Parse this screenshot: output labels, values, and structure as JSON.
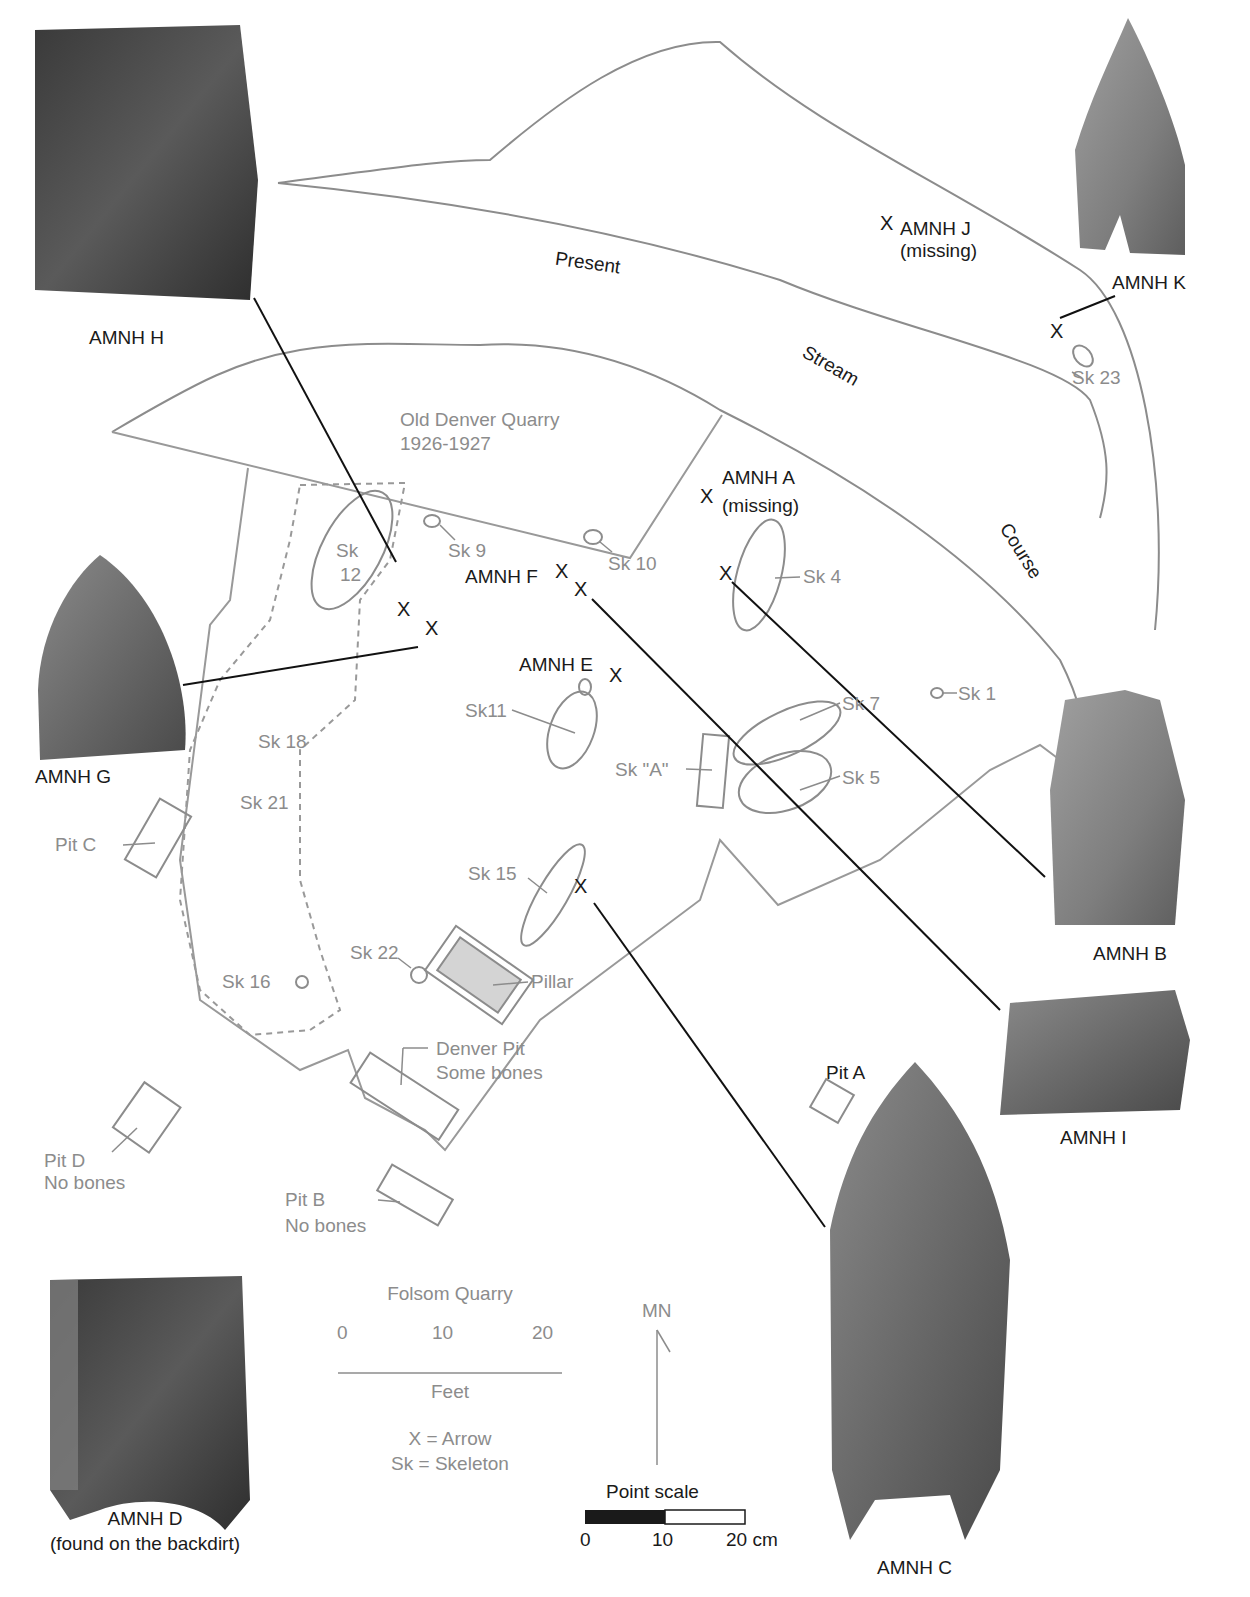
{
  "map": {
    "title": "Folsom Quarry",
    "stream_label": [
      "Present",
      "Stream",
      "Course"
    ],
    "quarry_label": [
      "Old Denver Quarry",
      "1926-1927"
    ],
    "scale": {
      "ticks": [
        "0",
        "10",
        "20"
      ],
      "unit": "Feet"
    },
    "legend": {
      "x": "X = Arrow",
      "sk": "Sk = Skeleton"
    },
    "north": "MN",
    "point_scale": {
      "title": "Point scale",
      "ticks": [
        "0",
        "10",
        "20 cm"
      ]
    }
  },
  "points": {
    "H": "AMNH H",
    "K": "AMNH K",
    "J": "AMNH J",
    "J_note": "(missing)",
    "A": "AMNH A",
    "A_note": "(missing)",
    "F": "AMNH F",
    "E": "AMNH E",
    "G": "AMNH G",
    "B": "AMNH B",
    "I": "AMNH I",
    "C": "AMNH C",
    "D": "AMNH D",
    "D_note": "(found on the backdirt)"
  },
  "skeletons": {
    "sk23": "Sk 23",
    "sk12a": "Sk",
    "sk12b": "12",
    "sk9": "Sk 9",
    "sk10": "Sk 10",
    "sk4": "Sk 4",
    "sk1": "Sk 1",
    "sk11": "Sk11",
    "sk7": "Sk 7",
    "sk5": "Sk 5",
    "skA": "Sk \"A\"",
    "sk18": "Sk 18",
    "sk21": "Sk 21",
    "sk15": "Sk 15",
    "sk22": "Sk 22",
    "sk16": "Sk 16"
  },
  "features": {
    "pillar": "Pillar",
    "pitA": "Pit A",
    "pitC": "Pit C",
    "pitD": "Pit D",
    "pitD_note": "No bones",
    "pitB": "Pit B",
    "pitB_note": "No bones",
    "denver": "Denver Pit",
    "denver_note": "Some bones"
  },
  "marker": "X"
}
